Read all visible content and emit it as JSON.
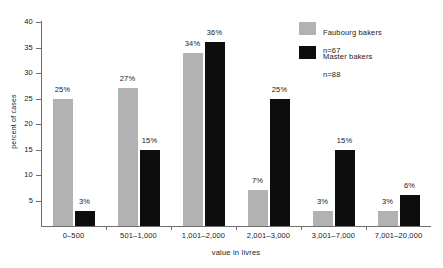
{
  "chart_data": {
    "type": "bar",
    "title": "",
    "subtitle": "",
    "xlabel": "value in livres",
    "ylabel": "percent of cases",
    "categories": [
      "0–500",
      "501–1,000",
      "1,001–2,000",
      "2,001–3,000",
      "3,001–7,000",
      "7,001–20,000"
    ],
    "series": [
      {
        "name": "Faubourg bakers",
        "n_label": "n=67",
        "color": "#b2b2b2",
        "values": [
          25,
          27,
          34,
          7,
          3,
          3
        ],
        "value_labels": [
          "25%",
          "27%",
          "34%",
          "7%",
          "3%",
          "3%"
        ]
      },
      {
        "name": "Master bakers",
        "n_label": "n=88",
        "color": "#0d0d0d",
        "values": [
          3,
          15,
          36,
          25,
          15,
          6
        ],
        "value_labels": [
          "3%",
          "15%",
          "36%",
          "25%",
          "15%",
          "6%"
        ]
      }
    ],
    "yticks": [
      5,
      10,
      15,
      20,
      25,
      30,
      35,
      40
    ],
    "ytick_labels": [
      "5",
      "10",
      "15",
      "20",
      "25",
      "30",
      "35",
      "40"
    ],
    "ylim": [
      0,
      40
    ],
    "grid": false,
    "legend_position": "top-right",
    "axis_color": "#6e6e6e"
  }
}
